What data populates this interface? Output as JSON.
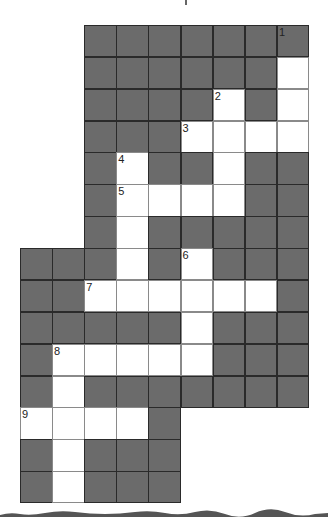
{
  "puzzle": {
    "type": "crossword",
    "rows": 15,
    "cols": 9,
    "cell_size_px": 32,
    "colors": {
      "block": "#6b6b6b",
      "block_border": "#2a2a2a",
      "open": "#ffffff",
      "open_border": "#8a8a8a",
      "number": "#222222"
    },
    "grid": [
      "__#######",
      "__######.",
      "__####.#.",
      "__###....",
      "__#.##.##",
      "__#....##",
      "__#.#####",
      "###.#.###",
      "##......#",
      "#####.###",
      "#.....###",
      "#.#######",
      "....#____",
      "#.###____",
      "#.###____"
    ],
    "legend": {
      "#": "block",
      ".": "open",
      "_": "empty"
    },
    "numbers": [
      {
        "label": "1",
        "row": 0,
        "col": 8
      },
      {
        "label": "2",
        "row": 2,
        "col": 6
      },
      {
        "label": "3",
        "row": 3,
        "col": 5
      },
      {
        "label": "4",
        "row": 4,
        "col": 3
      },
      {
        "label": "5",
        "row": 5,
        "col": 3
      },
      {
        "label": "6",
        "row": 7,
        "col": 5
      },
      {
        "label": "7",
        "row": 8,
        "col": 2
      },
      {
        "label": "8",
        "row": 10,
        "col": 1
      },
      {
        "label": "9",
        "row": 12,
        "col": 0
      }
    ]
  }
}
